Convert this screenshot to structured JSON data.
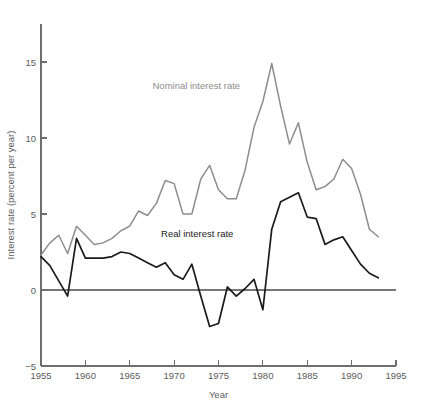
{
  "chart_data": {
    "type": "line",
    "title": "",
    "xlabel": "Year",
    "ylabel": "Interest rate (percent per year)",
    "xlim": [
      1955,
      1995
    ],
    "ylim": [
      -5,
      17.5
    ],
    "xticks": [
      1955,
      1960,
      1965,
      1970,
      1975,
      1980,
      1985,
      1990,
      1995
    ],
    "yticks": [
      -5,
      0,
      5,
      10,
      15
    ],
    "xtick_labels": [
      "1955",
      "1960",
      "1965",
      "1970",
      "1975",
      "1980",
      "1985",
      "1990",
      "1995"
    ],
    "ytick_labels": [
      "−5",
      "0",
      "5",
      "10",
      "15"
    ],
    "grid": false,
    "legend_position": "inline-annotations",
    "zero_reference_line": 0,
    "colors": {
      "nominal": "#8d8d8d",
      "real": "#1b1b1b",
      "axis": "#6e6e6e",
      "zero_line": "#777777",
      "background": "#ffffff"
    },
    "x": [
      1955,
      1956,
      1957,
      1958,
      1959,
      1960,
      1961,
      1962,
      1963,
      1964,
      1965,
      1966,
      1967,
      1968,
      1969,
      1970,
      1971,
      1972,
      1973,
      1974,
      1975,
      1976,
      1977,
      1978,
      1979,
      1980,
      1981,
      1982,
      1983,
      1984,
      1985,
      1986,
      1987,
      1988,
      1989,
      1990,
      1991,
      1992,
      1993
    ],
    "series": [
      {
        "name": "Nominal interest rate",
        "color": "#8d8d8d",
        "label_text": "Nominal interest rate",
        "label_x": 1972.5,
        "label_y": 13.2,
        "values": [
          2.3,
          3.1,
          3.6,
          2.4,
          4.2,
          3.6,
          3.0,
          3.1,
          3.4,
          3.9,
          4.2,
          5.2,
          4.9,
          5.7,
          7.2,
          7.0,
          5.0,
          5.0,
          7.3,
          8.2,
          6.6,
          6.0,
          6.0,
          7.9,
          10.7,
          12.4,
          14.9,
          12.1,
          9.6,
          11.0,
          8.4,
          6.6,
          6.8,
          7.3,
          8.6,
          8.0,
          6.3,
          4.0,
          3.5
        ]
      },
      {
        "name": "Real interest rate",
        "color": "#1b1b1b",
        "label_text": "Real interest rate",
        "label_x": 1972.6,
        "label_y": 3.5,
        "values": [
          2.2,
          1.6,
          0.6,
          -0.4,
          3.4,
          2.1,
          2.1,
          2.1,
          2.2,
          2.5,
          2.4,
          2.1,
          1.8,
          1.5,
          1.8,
          1.0,
          0.7,
          1.7,
          -0.4,
          -2.4,
          -2.2,
          0.2,
          -0.4,
          0.1,
          0.7,
          -1.3,
          4.0,
          5.8,
          6.1,
          6.4,
          4.8,
          4.7,
          3.0,
          3.3,
          3.5,
          2.6,
          1.7,
          1.1,
          0.8
        ]
      }
    ]
  },
  "figure": {
    "caption": "",
    "axis_labels": {
      "x": "Year",
      "y": "Interest rate (percent per year)"
    }
  }
}
